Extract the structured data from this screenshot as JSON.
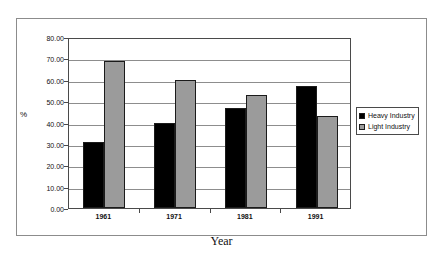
{
  "chart_data": {
    "type": "bar",
    "title": "",
    "xlabel": "Year",
    "ylabel": "%",
    "categories": [
      "1961",
      "1971",
      "1981",
      "1991"
    ],
    "series": [
      {
        "name": "Heavy Industry",
        "color": "#000000",
        "values": [
          31,
          40,
          47,
          57
        ]
      },
      {
        "name": "Light Industry",
        "color": "#9b9b9b",
        "values": [
          69,
          60,
          53,
          43
        ]
      }
    ],
    "ylim": [
      0,
      80
    ],
    "ytick_step": 10,
    "ytick_labels": [
      "80.00",
      "70.00",
      "60.00",
      "50.00",
      "40.00",
      "30.00",
      "20.00",
      "10.00",
      "0.00"
    ],
    "ytick_values": [
      80,
      70,
      60,
      50,
      40,
      30,
      20,
      10,
      0
    ],
    "grid": true,
    "legend_position": "right"
  },
  "legend": {
    "items": [
      {
        "label": "Heavy Industry",
        "swatch": "legend-swatch-heavy"
      },
      {
        "label": "Light Industry",
        "swatch": "legend-swatch-light"
      }
    ]
  }
}
